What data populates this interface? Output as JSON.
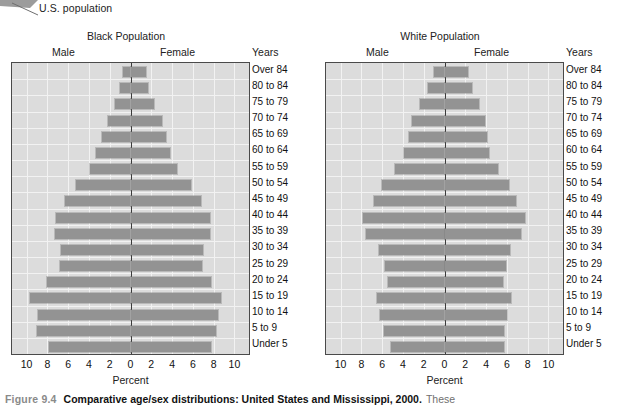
{
  "annotation": {
    "label": "U.S. population"
  },
  "caption": {
    "figure_number": "Figure 9.4",
    "title": "Comparative age/sex distributions: United States and Mississippi, 2000.",
    "tail": "These"
  },
  "axis": {
    "xlabel": "Percent",
    "years_header": "Years",
    "male_header": "Male",
    "female_header": "Female",
    "ticks": [
      "10",
      "8",
      "6",
      "4",
      "2",
      "0",
      "2",
      "4",
      "6",
      "8",
      "10"
    ],
    "tick_values": [
      -10,
      -8,
      -6,
      -4,
      -2,
      0,
      2,
      4,
      6,
      8,
      10
    ],
    "xlim": [
      -11.4,
      11.4
    ]
  },
  "age_groups": [
    "Over 84",
    "80 to 84",
    "75 to 79",
    "70 to 74",
    "65 to 69",
    "60 to 64",
    "55 to 59",
    "50 to 54",
    "45 to 49",
    "40 to 44",
    "35 to 39",
    "30 to 34",
    "25 to 29",
    "20 to 24",
    "15 to 19",
    "10 to 14",
    "5 to 9",
    "Under 5"
  ],
  "colors": {
    "bar": "#939393",
    "plot_background": "#dcdcdc",
    "gridline": "#f2f2f2",
    "axis_line": "#3a3a3a",
    "plot_border": "#4a4a4a",
    "caption_figno": "#8a8a8a"
  },
  "chart_data": [
    {
      "type": "bar",
      "id": "black-population",
      "title": "Black Population",
      "xlabel": "Percent",
      "ylabel": "Years",
      "orientation": "horizontal",
      "layout": "population-pyramid",
      "grid": true,
      "legend": false,
      "xlim": [
        -11.4,
        11.4
      ],
      "xticks": [
        -10,
        -8,
        -6,
        -4,
        -2,
        0,
        2,
        4,
        6,
        8,
        10
      ],
      "categories": [
        "Over 84",
        "80 to 84",
        "75 to 79",
        "70 to 74",
        "65 to 69",
        "60 to 64",
        "55 to 59",
        "50 to 54",
        "45 to 49",
        "40 to 44",
        "35 to 39",
        "30 to 34",
        "25 to 29",
        "20 to 24",
        "15 to 19",
        "10 to 14",
        "5 to 9",
        "Under 5"
      ],
      "series": [
        {
          "name": "Male",
          "side": "left",
          "values": [
            0.7,
            1.0,
            1.5,
            2.2,
            2.7,
            3.3,
            3.9,
            5.2,
            6.3,
            7.2,
            7.3,
            6.7,
            6.8,
            8.0,
            9.7,
            8.9,
            9.0,
            7.8
          ]
        },
        {
          "name": "Female",
          "side": "right",
          "values": [
            1.5,
            1.7,
            2.3,
            3.0,
            3.4,
            3.8,
            4.5,
            5.8,
            6.8,
            7.6,
            7.6,
            7.0,
            6.9,
            7.7,
            8.7,
            8.4,
            8.2,
            7.7
          ]
        }
      ]
    },
    {
      "type": "bar",
      "id": "white-population",
      "title": "White Population",
      "xlabel": "Percent",
      "ylabel": "Years",
      "orientation": "horizontal",
      "layout": "population-pyramid",
      "grid": true,
      "legend": false,
      "xlim": [
        -11.4,
        11.4
      ],
      "xticks": [
        -10,
        -8,
        -6,
        -4,
        -2,
        0,
        2,
        4,
        6,
        8,
        10
      ],
      "categories": [
        "Over 84",
        "80 to 84",
        "75 to 79",
        "70 to 74",
        "65 to 69",
        "60 to 64",
        "55 to 59",
        "50 to 54",
        "45 to 49",
        "40 to 44",
        "35 to 39",
        "30 to 34",
        "25 to 29",
        "20 to 24",
        "15 to 19",
        "10 to 14",
        "5 to 9",
        "Under 5"
      ],
      "series": [
        {
          "name": "Male",
          "side": "left",
          "values": [
            1.0,
            1.6,
            2.4,
            3.1,
            3.4,
            3.9,
            4.8,
            6.0,
            6.8,
            7.8,
            7.6,
            6.3,
            5.7,
            5.4,
            6.5,
            6.2,
            5.8,
            5.1
          ]
        },
        {
          "name": "Female",
          "side": "right",
          "values": [
            2.3,
            2.6,
            3.3,
            3.9,
            4.1,
            4.3,
            5.1,
            6.2,
            6.9,
            7.7,
            7.4,
            6.3,
            5.9,
            5.6,
            6.4,
            6.0,
            5.7,
            5.7
          ]
        }
      ]
    }
  ]
}
